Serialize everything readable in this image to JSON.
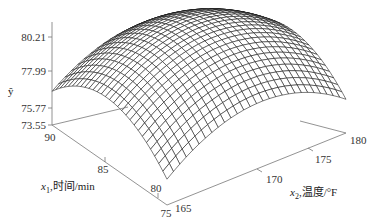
{
  "chart_data": {
    "type": "surface3d",
    "title": "",
    "z_axis": {
      "label": "ŷ",
      "ticks": [
        "73.55",
        "75.77",
        "77.99",
        "80.21"
      ],
      "range": [
        73.55,
        81.5
      ]
    },
    "x1_axis": {
      "label_var": "x",
      "label_sub": "1",
      "label_text": ",时间/min",
      "ticks": [
        "90",
        "85",
        "80",
        "75"
      ],
      "range": [
        75,
        90
      ]
    },
    "x2_axis": {
      "label_var": "x",
      "label_sub": "2",
      "label_text": ",温度/°F",
      "ticks": [
        "165",
        "170",
        "175",
        "180"
      ],
      "range": [
        165,
        180
      ]
    },
    "surface": {
      "description": "Concave-down quadratic response surface with maximum near the center of the x1-x2 domain",
      "z_max_approx": 81.2,
      "z_corner_approx": 75.8,
      "grid_lines": 28
    },
    "grid": false,
    "legend": null
  }
}
